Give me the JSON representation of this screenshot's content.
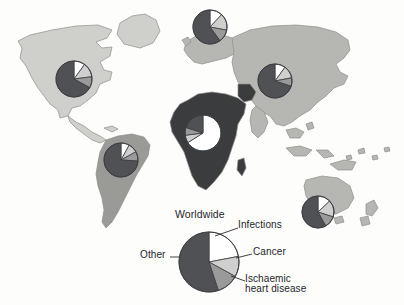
{
  "figure": {
    "background_color": "#fdfdfb"
  },
  "legend": {
    "title": "Worldwide",
    "labels": {
      "infections": "Infections",
      "cancer": "Cancer",
      "ischaemic": "Ischaemic\nheart disease",
      "other": "Other"
    }
  },
  "palette": {
    "infections": "#ffffff",
    "cancer": "#cfcfcf",
    "ischaemic": "#9a9a9a",
    "other": "#4f5154",
    "outline": "#3c3f43",
    "land_light": "#cfd0cc",
    "land_mid": "#9a9b97",
    "land_dark": "#3a3c3e",
    "land_asia": "#b6b7b3",
    "text": "#23262b"
  },
  "chart_data": {
    "type": "pie",
    "title": "Worldwide",
    "categories": [
      "Infections",
      "Cancer",
      "Ischaemic heart disease",
      "Other"
    ],
    "colors": [
      "#ffffff",
      "#cfcfcf",
      "#9a9a9a",
      "#4f5154"
    ],
    "legend_position": "around-pie",
    "grid": false,
    "charts": [
      {
        "name": "worldwide",
        "region": "Worldwide",
        "cx": 209,
        "cy": 262,
        "r": 30,
        "values": [
          22,
          11,
          12,
          55
        ]
      },
      {
        "name": "north-america",
        "region": "North America",
        "cx": 74,
        "cy": 79,
        "r": 18,
        "values": [
          10,
          13,
          10,
          67
        ]
      },
      {
        "name": "europe",
        "region": "Europe",
        "cx": 210,
        "cy": 27,
        "r": 17,
        "values": [
          12,
          16,
          12,
          60
        ]
      },
      {
        "name": "asia",
        "region": "Asia",
        "cx": 275,
        "cy": 81,
        "r": 17,
        "values": [
          10,
          12,
          8,
          70
        ]
      },
      {
        "name": "africa",
        "region": "Africa",
        "cx": 203,
        "cy": 133,
        "r": 18,
        "values": [
          66,
          7,
          7,
          20
        ]
      },
      {
        "name": "south-america",
        "region": "South America",
        "cx": 121,
        "cy": 160,
        "r": 17,
        "values": [
          8,
          9,
          9,
          74
        ]
      },
      {
        "name": "australia",
        "region": "Australia",
        "cx": 318,
        "cy": 212,
        "r": 16,
        "values": [
          13,
          17,
          12,
          58
        ]
      }
    ]
  }
}
